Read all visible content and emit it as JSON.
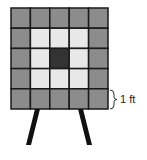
{
  "diagram": {
    "grid": {
      "rows": 5,
      "cols": 5,
      "cells": [
        [
          "outer",
          "outer",
          "outer",
          "outer",
          "outer"
        ],
        [
          "outer",
          "inner",
          "inner",
          "inner",
          "outer"
        ],
        [
          "outer",
          "inner",
          "center",
          "inner",
          "outer"
        ],
        [
          "outer",
          "inner",
          "inner",
          "inner",
          "outer"
        ],
        [
          "outer",
          "outer",
          "outer",
          "outer",
          "outer"
        ]
      ]
    },
    "colors": {
      "outer": "#8c8c8c",
      "inner": "#e8e8e8",
      "center": "#333333",
      "border": "#1a1a1a",
      "legs": "#111111"
    },
    "dimension_label": "1 ft"
  }
}
